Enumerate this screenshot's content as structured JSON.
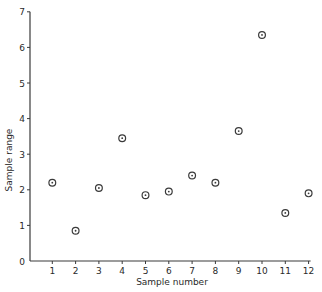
{
  "chart_data": {
    "type": "scatter",
    "title": "",
    "xlabel": "Sample number",
    "ylabel": "Sample range",
    "xlim": [
      0,
      12
    ],
    "ylim": [
      0,
      7
    ],
    "grid": false,
    "legend": null,
    "x_ticks": [
      1,
      2,
      3,
      4,
      5,
      6,
      7,
      8,
      9,
      10,
      11,
      12
    ],
    "y_ticks": [
      0,
      1,
      2,
      3,
      4,
      5,
      6,
      7
    ],
    "marker": "circle-with-dot",
    "series": [
      {
        "name": "Sample range",
        "x": [
          1,
          2,
          3,
          4,
          5,
          6,
          7,
          8,
          9,
          10,
          11,
          12
        ],
        "y": [
          2.2,
          0.85,
          2.05,
          3.45,
          1.85,
          1.95,
          2.4,
          2.2,
          3.65,
          6.35,
          1.35,
          1.9
        ]
      }
    ]
  },
  "colors": {
    "axis": "#3a3a3a",
    "marker": "#3a3a3a",
    "background": "#ffffff"
  }
}
